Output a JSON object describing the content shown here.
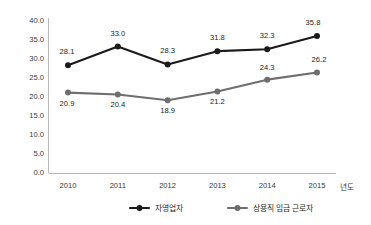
{
  "chart_data": {
    "type": "line",
    "title": "",
    "subtitle": "",
    "xlabel": "년도",
    "ylabel": "",
    "categories": [
      "2010",
      "2011",
      "2012",
      "2013",
      "2014",
      "2015"
    ],
    "ylim": [
      0.0,
      40.0
    ],
    "ytick_step": 5.0,
    "yticks": [
      "0.0",
      "5.0",
      "10.0",
      "15.0",
      "20.0",
      "25.0",
      "30.0",
      "35.0",
      "40.0"
    ],
    "grid": false,
    "legend_position": "bottom",
    "series": [
      {
        "name": "자영업자",
        "color": "#1a1a1a",
        "marker": "circle",
        "values": [
          28.1,
          33.0,
          28.3,
          31.8,
          32.3,
          35.8
        ],
        "labels": [
          "28.1",
          "33.0",
          "28.3",
          "31.8",
          "32.3",
          "35.8"
        ]
      },
      {
        "name": "상용직 임금 근로자",
        "color": "#6e6e6e",
        "marker": "circle",
        "values": [
          20.9,
          20.4,
          18.9,
          21.2,
          24.3,
          26.2
        ],
        "labels": [
          "20.9",
          "20.4",
          "18.9",
          "21.2",
          "24.3",
          "26.2"
        ]
      }
    ]
  },
  "legend": {
    "items": [
      {
        "label": "자영업자",
        "color": "#1a1a1a"
      },
      {
        "label": "상용직 임금 근로자",
        "color": "#6e6e6e"
      }
    ]
  },
  "axes": {
    "x_axis_title": "년도",
    "y_axis_title": ""
  }
}
